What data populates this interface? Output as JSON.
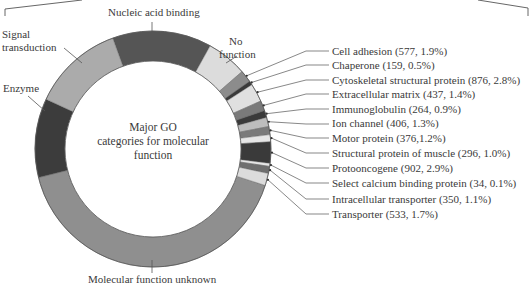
{
  "chart_data": {
    "type": "pie",
    "subtype": "donut",
    "title": "Major GO categories for molecular function",
    "center_label_lines": [
      "Major GO",
      "categories for molecular",
      "function"
    ],
    "major_segments": [
      {
        "label": "Nucleic acid binding",
        "start_deg": 340,
        "end_deg": 29,
        "color": "#555555"
      },
      {
        "label": "No function",
        "start_deg": 29,
        "end_deg": 49,
        "color": "#dcdcdc"
      },
      {
        "label": "Molecular function unknown",
        "start_deg": 108,
        "end_deg": 256,
        "color": "#8f8f8f"
      },
      {
        "label": "Enzyme",
        "start_deg": 256,
        "end_deg": 295,
        "color": "#3c3c3c"
      },
      {
        "label": "Signal transduction",
        "start_deg": 295,
        "end_deg": 340,
        "color": "#ababab"
      }
    ],
    "minor_segments": [
      {
        "label": "Cell adhesion",
        "count": 577,
        "percent": 1.9,
        "start_deg": 49,
        "end_deg": 55,
        "color": "#8c8c8c"
      },
      {
        "label": "Chaperone",
        "count": 159,
        "percent": 0.5,
        "start_deg": 55,
        "end_deg": 57,
        "color": "#3a3a3a"
      },
      {
        "label": "Cytoskeletal structural protein",
        "count": 876,
        "percent": 2.8,
        "start_deg": 57,
        "end_deg": 66,
        "color": "#e0e0e0"
      },
      {
        "label": "Extracellular matrix",
        "count": 437,
        "percent": 1.4,
        "start_deg": 66,
        "end_deg": 71,
        "color": "#7a7a7a"
      },
      {
        "label": "Immunoglobulin",
        "count": 264,
        "percent": 0.9,
        "start_deg": 71,
        "end_deg": 74.5,
        "color": "#3a3a3a"
      },
      {
        "label": "Ion channel",
        "count": 406,
        "percent": 1.3,
        "start_deg": 74.5,
        "end_deg": 79,
        "color": "#bdbdbd"
      },
      {
        "label": "Motor protein",
        "count": 376,
        "percent": 1.2,
        "start_deg": 79,
        "end_deg": 83,
        "color": "#7a7a7a"
      },
      {
        "label": "Structural protein of muscle",
        "count": 296,
        "percent": 1.0,
        "start_deg": 83,
        "end_deg": 86.5,
        "color": "#e6e6e6"
      },
      {
        "label": "Protooncogene",
        "count": 902,
        "percent": 2.9,
        "start_deg": 86.5,
        "end_deg": 97,
        "color": "#3a3a3a"
      },
      {
        "label": "Select calcium binding protein",
        "count": 34,
        "percent": 0.1,
        "start_deg": 97,
        "end_deg": 98.5,
        "color": "#e6e6e6"
      },
      {
        "label": "Intracellular transporter",
        "count": 350,
        "percent": 1.1,
        "start_deg": 98.5,
        "end_deg": 102,
        "color": "#6e6e6e"
      },
      {
        "label": "Transporter",
        "count": 533,
        "percent": 1.7,
        "start_deg": 102,
        "end_deg": 108,
        "color": "#dcdcdc"
      }
    ],
    "legend_position": "right (callout labels)"
  },
  "labels": {
    "nucleic": "Nucleic acid binding",
    "signal_1": "Signal",
    "signal_2": "transduction",
    "enzyme": "Enzyme",
    "nofunc_1": "No",
    "nofunc_2": "function",
    "unknown": "Molecular function unknown",
    "center_1": "Major GO",
    "center_2": "categories for molecular",
    "center_3": "function"
  },
  "right_labels": [
    "Cell adhesion (577, 1.9%)",
    "Chaperone (159, 0.5%)",
    "Cytoskeletal structural protein (876, 2.8%)",
    "Extracellular matrix (437, 1.4%)",
    "Immunoglobulin (264, 0.9%)",
    "Ion channel (406, 1.3%)",
    "Motor protein (376,1.2%)",
    "Structural protein of muscle (296, 1.0%)",
    "Protooncogene (902, 2.9%)",
    "Select calcium binding protein (34, 0.1%)",
    "Intracellular transporter (350, 1.1%)",
    "Transporter (533, 1.7%)"
  ]
}
